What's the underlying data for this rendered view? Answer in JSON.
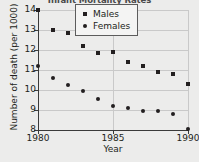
{
  "chart_data": {
    "type": "scatter",
    "title": "Infant Mortality Rates",
    "xlabel": "Year",
    "ylabel": "Number of death (per 1000)",
    "xlim": [
      1980,
      1990
    ],
    "ylim": [
      8,
      14
    ],
    "grid": true,
    "legend_position": "top-right",
    "x": [
      1980,
      1981,
      1982,
      1983,
      1984,
      1985,
      1986,
      1987,
      1988,
      1989,
      1990
    ],
    "xticks": [
      1980,
      1985,
      1990
    ],
    "xtick_labels": [
      "1980",
      "1985",
      "1990"
    ],
    "yticks": [
      8,
      9,
      10,
      11,
      12,
      13,
      14
    ],
    "ytick_labels": [
      "8",
      "9",
      "10",
      "11",
      "12",
      "13",
      "14"
    ],
    "series": [
      {
        "name": "Males",
        "marker": "square",
        "color": "#231f20",
        "values": [
          14.0,
          13.0,
          12.85,
          12.2,
          11.85,
          11.9,
          11.4,
          11.2,
          10.9,
          10.8,
          10.3
        ]
      },
      {
        "name": "Females",
        "marker": "circle",
        "color": "#231f20",
        "values": [
          11.2,
          10.6,
          10.25,
          9.95,
          9.55,
          9.2,
          9.1,
          8.95,
          8.95,
          8.8,
          8.05
        ]
      }
    ]
  },
  "legend": {
    "items": [
      {
        "label": "Males",
        "marker": "square"
      },
      {
        "label": "Females",
        "marker": "circle"
      }
    ]
  }
}
